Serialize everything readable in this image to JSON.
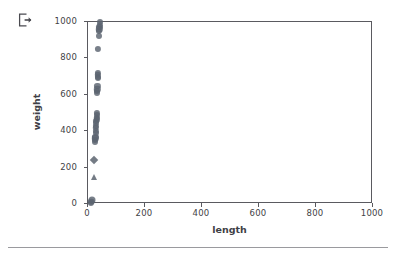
{
  "toolbar": {
    "export_icon": "export-icon"
  },
  "chart_data": {
    "type": "scatter",
    "title": "",
    "xlabel": "length",
    "ylabel": "weight",
    "xlim": [
      0,
      1000
    ],
    "ylim": [
      0,
      1000
    ],
    "xticks": [
      0,
      200,
      400,
      600,
      800,
      1000
    ],
    "yticks": [
      0,
      200,
      400,
      600,
      800,
      1000
    ],
    "xticklabels": [
      "0",
      "200",
      "400",
      "600",
      "800",
      "1000"
    ],
    "yticklabels": [
      "0",
      "200",
      "400",
      "600",
      "800",
      "1000"
    ],
    "grid": false,
    "legend": null,
    "marker_color": "#5c6470",
    "points": [
      {
        "x": 41,
        "y": 1000,
        "marker": "circle",
        "size": 6.0
      },
      {
        "x": 41,
        "y": 985,
        "marker": "circle",
        "size": 6.2
      },
      {
        "x": 40,
        "y": 975,
        "marker": "circle",
        "size": 6.2
      },
      {
        "x": 39,
        "y": 960,
        "marker": "circle",
        "size": 6.4
      },
      {
        "x": 38,
        "y": 950,
        "marker": "circle",
        "size": 6.2
      },
      {
        "x": 37,
        "y": 925,
        "marker": "circle",
        "size": 6.0
      },
      {
        "x": 36,
        "y": 850,
        "marker": "circle",
        "size": 6.2
      },
      {
        "x": 35,
        "y": 720,
        "marker": "circle",
        "size": 6.2
      },
      {
        "x": 35,
        "y": 710,
        "marker": "circle",
        "size": 6.4
      },
      {
        "x": 34,
        "y": 700,
        "marker": "circle",
        "size": 6.2
      },
      {
        "x": 34,
        "y": 690,
        "marker": "circle",
        "size": 6.0
      },
      {
        "x": 33,
        "y": 650,
        "marker": "circle",
        "size": 6.2
      },
      {
        "x": 33,
        "y": 630,
        "marker": "circle",
        "size": 6.4
      },
      {
        "x": 32,
        "y": 620,
        "marker": "circle",
        "size": 6.2
      },
      {
        "x": 32,
        "y": 610,
        "marker": "circle",
        "size": 6.0
      },
      {
        "x": 31,
        "y": 500,
        "marker": "circle",
        "size": 6.2
      },
      {
        "x": 31,
        "y": 490,
        "marker": "circle",
        "size": 6.0
      },
      {
        "x": 30,
        "y": 475,
        "marker": "circle",
        "size": 6.4
      },
      {
        "x": 30,
        "y": 465,
        "marker": "circle",
        "size": 6.2
      },
      {
        "x": 29,
        "y": 455,
        "marker": "circle",
        "size": 6.2
      },
      {
        "x": 29,
        "y": 445,
        "marker": "circle",
        "size": 6.0
      },
      {
        "x": 28,
        "y": 430,
        "marker": "circle",
        "size": 6.2
      },
      {
        "x": 28,
        "y": 420,
        "marker": "circle",
        "size": 6.4
      },
      {
        "x": 27,
        "y": 400,
        "marker": "circle",
        "size": 6.2
      },
      {
        "x": 27,
        "y": 390,
        "marker": "circle",
        "size": 6.0
      },
      {
        "x": 26,
        "y": 370,
        "marker": "circle",
        "size": 6.2
      },
      {
        "x": 26,
        "y": 360,
        "marker": "circle",
        "size": 6.4
      },
      {
        "x": 25,
        "y": 350,
        "marker": "circle",
        "size": 6.2
      },
      {
        "x": 24,
        "y": 340,
        "marker": "circle",
        "size": 6.0
      },
      {
        "x": 22,
        "y": 242,
        "marker": "diamond",
        "size": 6.0
      },
      {
        "x": 21,
        "y": 150,
        "marker": "triangle",
        "size": 6.0
      },
      {
        "x": 14,
        "y": 20,
        "marker": "circle",
        "size": 7.0
      },
      {
        "x": 12,
        "y": 12,
        "marker": "circle",
        "size": 6.6
      },
      {
        "x": 11,
        "y": 8,
        "marker": "circle",
        "size": 6.2
      }
    ]
  }
}
